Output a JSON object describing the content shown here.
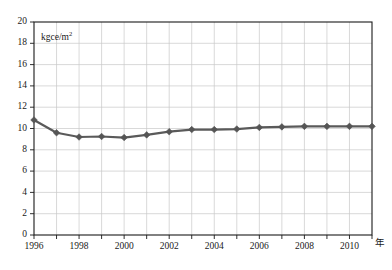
{
  "chart_data": {
    "type": "line",
    "title": "",
    "xlabel": "年",
    "ylabel": "",
    "unit_label": "kgce/m",
    "unit_exponent": "2",
    "x": [
      1996,
      1997,
      1998,
      1999,
      2000,
      2001,
      2002,
      2003,
      2004,
      2005,
      2006,
      2007,
      2008,
      2009,
      2010,
      2011
    ],
    "values": [
      10.8,
      9.6,
      9.2,
      9.25,
      9.15,
      9.4,
      9.7,
      9.9,
      9.9,
      9.95,
      10.1,
      10.15,
      10.2,
      10.2,
      10.2,
      10.2
    ],
    "series": [
      {
        "name": "kgce/m2",
        "values": [
          10.8,
          9.6,
          9.2,
          9.25,
          9.15,
          9.4,
          9.7,
          9.9,
          9.9,
          9.95,
          10.1,
          10.15,
          10.2,
          10.2,
          10.2,
          10.2
        ]
      }
    ],
    "ylim": [
      0,
      20
    ],
    "xlim": [
      1996,
      2011
    ],
    "ytick_values": [
      0,
      2,
      4,
      6,
      8,
      10,
      12,
      14,
      16,
      18,
      20
    ],
    "ytick_labels": [
      "0",
      "2",
      "4",
      "6",
      "8",
      "10",
      "12",
      "14",
      "16",
      "18",
      "20"
    ],
    "xtick_values": [
      1996,
      1997,
      1998,
      1999,
      2000,
      2001,
      2002,
      2003,
      2004,
      2005,
      2006,
      2007,
      2008,
      2009,
      2010,
      2011
    ],
    "xtick_labels": [
      "1996",
      "",
      "1998",
      "",
      "2000",
      "",
      "2002",
      "",
      "2004",
      "",
      "2006",
      "",
      "2008",
      "",
      "2010",
      ""
    ],
    "grid": true,
    "legend": "none",
    "marker": "diamond",
    "colors": {
      "line": "#5a5a5a",
      "marker": "#555555",
      "grid": "#c8c8c8",
      "frame": "#1a1a1a",
      "text": "#1a1a1a",
      "background": "#ffffff"
    }
  }
}
